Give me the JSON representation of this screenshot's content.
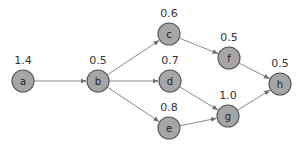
{
  "diagram": {
    "type": "directed-graph",
    "colors": {
      "node_fill": "#a6a6a6",
      "node_stroke": "#555555",
      "edge": "#8a8a8a",
      "text": "#333333"
    },
    "nodes": [
      {
        "id": "a",
        "label": "a",
        "weight": "1.4",
        "x": 23,
        "y": 81
      },
      {
        "id": "b",
        "label": "b",
        "weight": "0.5",
        "x": 98,
        "y": 81
      },
      {
        "id": "c",
        "label": "c",
        "weight": "0.6",
        "x": 169,
        "y": 34
      },
      {
        "id": "d",
        "label": "d",
        "weight": "0.7",
        "x": 170,
        "y": 81
      },
      {
        "id": "e",
        "label": "e",
        "weight": "0.8",
        "x": 169,
        "y": 128
      },
      {
        "id": "f",
        "label": "f",
        "weight": "0.5",
        "x": 229,
        "y": 58
      },
      {
        "id": "g",
        "label": "g",
        "weight": "1.0",
        "x": 228,
        "y": 116
      },
      {
        "id": "h",
        "label": "h",
        "weight": "0.5",
        "x": 280,
        "y": 84
      }
    ],
    "edges": [
      {
        "from": "a",
        "to": "b"
      },
      {
        "from": "b",
        "to": "c"
      },
      {
        "from": "b",
        "to": "d"
      },
      {
        "from": "b",
        "to": "e"
      },
      {
        "from": "c",
        "to": "f"
      },
      {
        "from": "d",
        "to": "g"
      },
      {
        "from": "e",
        "to": "g"
      },
      {
        "from": "f",
        "to": "h"
      },
      {
        "from": "g",
        "to": "h"
      }
    ]
  }
}
